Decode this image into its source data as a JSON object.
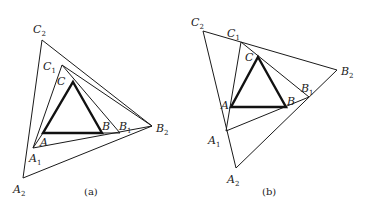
{
  "figures": [
    {
      "id": "a",
      "caption": "(a)",
      "labels": {
        "C2": {
          "base": "C",
          "sub": "2"
        },
        "C1": {
          "base": "C",
          "sub": "1"
        },
        "C": {
          "base": "C",
          "sub": ""
        },
        "A": {
          "base": "A",
          "sub": ""
        },
        "A1": {
          "base": "A",
          "sub": "1"
        },
        "A2": {
          "base": "A",
          "sub": "2"
        },
        "B": {
          "base": "B",
          "sub": ""
        },
        "B1": {
          "base": "B",
          "sub": "1"
        },
        "B2": {
          "base": "B",
          "sub": "2"
        }
      }
    },
    {
      "id": "b",
      "caption": "(b)",
      "labels": {
        "C2": {
          "base": "C",
          "sub": "2"
        },
        "C1": {
          "base": "C",
          "sub": "1"
        },
        "C": {
          "base": "C",
          "sub": ""
        },
        "A": {
          "base": "A",
          "sub": ""
        },
        "A1": {
          "base": "A",
          "sub": "1"
        },
        "A2": {
          "base": "A",
          "sub": "2"
        },
        "B": {
          "base": "B",
          "sub": ""
        },
        "B1": {
          "base": "B",
          "sub": "1"
        },
        "B2": {
          "base": "B",
          "sub": "2"
        }
      }
    }
  ]
}
